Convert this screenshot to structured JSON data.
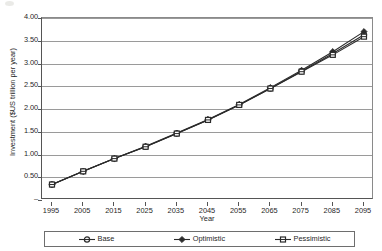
{
  "chart_data": {
    "type": "line",
    "title": "",
    "xlabel": "Year",
    "ylabel": "Investment ($US trillion per year)",
    "x": [
      1995,
      2005,
      2015,
      2025,
      2035,
      2045,
      2055,
      2065,
      2075,
      2085,
      2095
    ],
    "categories": [
      "1995",
      "2005",
      "2015",
      "2025",
      "2035",
      "2045",
      "2055",
      "2065",
      "2075",
      "2085",
      "2095"
    ],
    "ylim": [
      0,
      4.0
    ],
    "ytick_values": [
      0,
      0.5,
      1.0,
      1.5,
      2.0,
      2.5,
      3.0,
      3.5,
      4.0
    ],
    "ytick_labels": [
      "–",
      "0.50",
      "1.00",
      "1.50",
      "2.00",
      "2.50",
      "3.00",
      "3.50",
      "4.00"
    ],
    "grid": true,
    "legend_position": "bottom",
    "series": [
      {
        "name": "Base",
        "marker": "circle",
        "color": "#2b2b2b",
        "values": [
          0.34,
          0.63,
          0.91,
          1.17,
          1.46,
          1.76,
          2.09,
          2.45,
          2.83,
          3.22,
          3.63
        ]
      },
      {
        "name": "Optimistic",
        "marker": "diamond",
        "color": "#2b2b2b",
        "values": [
          0.34,
          0.63,
          0.91,
          1.18,
          1.47,
          1.77,
          2.1,
          2.47,
          2.85,
          3.26,
          3.7
        ]
      },
      {
        "name": "Pessimistic",
        "marker": "square",
        "color": "#2b2b2b",
        "values": [
          0.34,
          0.63,
          0.91,
          1.17,
          1.46,
          1.76,
          2.09,
          2.45,
          2.82,
          3.19,
          3.59
        ]
      }
    ]
  },
  "legend": {
    "entries": [
      {
        "label": "Base",
        "marker": "circle"
      },
      {
        "label": "Optimistic",
        "marker": "diamond"
      },
      {
        "label": "Pessimistic",
        "marker": "square"
      }
    ]
  }
}
